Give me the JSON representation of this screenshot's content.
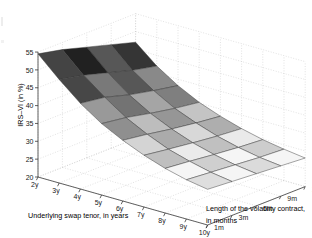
{
  "figure": {
    "type": "surface3d",
    "background": "#ffffff",
    "axis_line_color": "#3a3a3a",
    "grid_color": "#c9c9c9",
    "mesh_edge_color": "#333333"
  },
  "chart_data": {
    "type": "heatmap",
    "render": "3d-surface-mesh",
    "title": "",
    "xlabel": "Underlying swap tenor, in years",
    "zlabel": "Length of the volatility contract, in months",
    "ylabel": "IRS–VI (in %)",
    "x_categories": [
      "2y",
      "3y",
      "4y",
      "5y",
      "6y",
      "7y",
      "8y",
      "9y",
      "10y"
    ],
    "x_tick_labels": [
      "2y",
      "3y",
      "4y",
      "5y",
      "6y",
      "7y",
      "8y",
      "9y",
      "10y"
    ],
    "z_categories": [
      "1m",
      "3m",
      "6m",
      "9m",
      "12m"
    ],
    "z_tick_labels": [
      "1m",
      "3m",
      "6m",
      "9m",
      "12m"
    ],
    "y_tick_labels": [
      "20",
      "25",
      "30",
      "35",
      "40",
      "45",
      "50",
      "55"
    ],
    "y_ticks": [
      20,
      25,
      30,
      35,
      40,
      45,
      50,
      55
    ],
    "ylim": [
      20,
      55
    ],
    "grid": true,
    "legend": "none",
    "colormap": "gray",
    "series": [
      {
        "name": "1m",
        "values": [
          54.5,
          49.0,
          44.0,
          40.0,
          37.0,
          34.5,
          32.5,
          31.0,
          30.0
        ]
      },
      {
        "name": "3m",
        "values": [
          53.0,
          47.5,
          43.0,
          39.0,
          36.0,
          33.5,
          31.8,
          30.4,
          29.5
        ]
      },
      {
        "name": "6m",
        "values": [
          51.0,
          45.5,
          41.0,
          37.5,
          34.8,
          32.6,
          31.0,
          29.8,
          29.0
        ]
      },
      {
        "name": "9m",
        "values": [
          49.0,
          43.5,
          39.5,
          36.2,
          33.8,
          31.8,
          30.3,
          29.2,
          28.5
        ]
      },
      {
        "name": "12m",
        "values": [
          47.0,
          42.0,
          38.2,
          35.2,
          33.0,
          31.2,
          29.8,
          28.8,
          28.0
        ]
      }
    ]
  }
}
